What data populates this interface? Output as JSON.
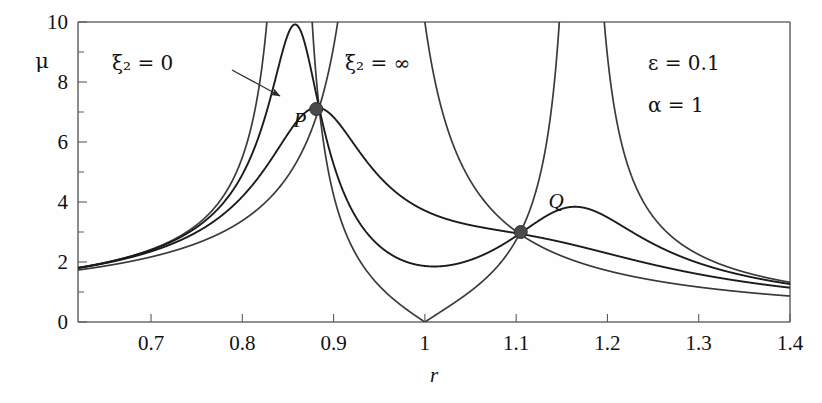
{
  "figure": {
    "title_alt": "Magnification factor versus frequency ratio for a damped vibration absorber",
    "background": "#fefefe",
    "frame_color": "#5b5b5b",
    "curve_color": "#1b1b1b"
  },
  "annotations": {
    "xi_zero": "ξ₂ = 0",
    "xi_inf": "ξ₂ = ∞",
    "epsilon": "ε = 0.1",
    "alpha": "α = 1",
    "point_p": "P",
    "point_q": "Q"
  },
  "axes": {
    "x_label": "r",
    "y_label": "μ",
    "x_ticks": [
      "0.7",
      "0.8",
      "0.9",
      "1",
      "1.1",
      "1.2",
      "1.3",
      "1.4"
    ],
    "x_tick_values": [
      0.7,
      0.8,
      0.9,
      1.0,
      1.1,
      1.2,
      1.3,
      1.4
    ],
    "y_ticks": [
      "0",
      "2",
      "4",
      "6",
      "8",
      "10"
    ],
    "y_tick_values": [
      0,
      2,
      4,
      6,
      8,
      10
    ],
    "y_minor_values": [
      1,
      3,
      5,
      7,
      9
    ],
    "xlim": [
      0.62,
      1.4
    ],
    "ylim": [
      0,
      10
    ],
    "grid": false
  },
  "chart_data": {
    "type": "line",
    "title": "",
    "xlabel": "r",
    "ylabel": "μ",
    "xlim": [
      0.62,
      1.4
    ],
    "ylim": [
      0,
      10
    ],
    "grid": false,
    "legend": "inline-annotations",
    "parameters": {
      "epsilon": 0.1,
      "alpha": 1,
      "mass_ratio_label": "ε = 0.1",
      "tuning_ratio_label": "α = 1"
    },
    "series": [
      {
        "name": "ξ₂ = 0",
        "damping_ratio": 0,
        "style": "solid",
        "description": "Undamped absorber: two vertical asymptotes and a zero at r = 1",
        "asymptotes": [
          0.826,
          1.211
        ],
        "zero_at": 1.0,
        "x": [
          0.62,
          0.65,
          0.7,
          0.75,
          0.78,
          0.8,
          0.81,
          0.82,
          0.824,
          0.828,
          0.835,
          0.85,
          0.88,
          0.92,
          0.95,
          0.98,
          1.0,
          1.02,
          1.05,
          1.08,
          1.105,
          1.14,
          1.17,
          1.19,
          1.205,
          1.215,
          1.23,
          1.26,
          1.3,
          1.35,
          1.4
        ],
        "y": [
          1.75,
          1.95,
          2.55,
          3.75,
          5.2,
          7.2,
          9.0,
          14.0,
          22.0,
          24.0,
          12.0,
          6.2,
          3.2,
          1.85,
          1.1,
          0.45,
          0.0,
          0.45,
          1.15,
          2.1,
          3.0,
          5.0,
          9.5,
          16.0,
          26.0,
          24.0,
          9.0,
          4.2,
          2.4,
          1.5,
          1.05
        ]
      },
      {
        "name": "ξ₂ = 0.10 (light damping)",
        "damping_ratio": 0.1,
        "style": "solid",
        "description": "Lightly damped: tall peak near r = 0.86, secondary peak beyond Q",
        "peaks": [
          {
            "r": 0.86,
            "mu": 9.6
          },
          {
            "r": 1.19,
            "mu": 9.0
          }
        ],
        "x": [
          0.62,
          0.7,
          0.78,
          0.82,
          0.84,
          0.86,
          0.875,
          0.88,
          0.9,
          0.94,
          1.0,
          1.05,
          1.105,
          1.14,
          1.17,
          1.2,
          1.25,
          1.3,
          1.4
        ],
        "y": [
          1.75,
          2.5,
          4.6,
          7.4,
          8.9,
          9.6,
          8.2,
          7.1,
          5.2,
          3.3,
          2.15,
          2.4,
          3.0,
          3.6,
          3.75,
          3.6,
          2.6,
          2.0,
          1.25
        ]
      },
      {
        "name": "ξ₂ = 0.20 (optimal-type damping)",
        "damping_ratio": 0.2,
        "style": "solid",
        "description": "Moderately damped: broad peak near r = 0.92 passing through P and Q",
        "peaks": [
          {
            "r": 0.92,
            "mu": 8.0
          },
          {
            "r": 1.17,
            "mu": 3.75
          }
        ],
        "x": [
          0.62,
          0.7,
          0.78,
          0.84,
          0.88,
          0.9,
          0.92,
          0.95,
          1.0,
          1.05,
          1.105,
          1.14,
          1.17,
          1.2,
          1.25,
          1.3,
          1.4
        ],
        "y": [
          1.72,
          2.4,
          4.0,
          6.2,
          7.1,
          7.7,
          8.0,
          7.6,
          5.6,
          4.0,
          3.0,
          2.4,
          2.05,
          1.85,
          1.6,
          1.4,
          1.05
        ]
      },
      {
        "name": "ξ₂ = ∞",
        "damping_ratio": "infinity",
        "style": "solid",
        "description": "Absorber locked to primary mass: single resonance asymptote near r = 1.14",
        "asymptotes": [
          1.138
        ],
        "x": [
          0.62,
          0.7,
          0.8,
          0.86,
          0.88,
          0.95,
          1.02,
          1.06,
          1.1,
          1.12,
          1.132,
          1.142,
          1.16,
          1.19,
          1.23,
          1.28,
          1.34,
          1.4
        ],
        "y": [
          1.7,
          2.2,
          3.2,
          5.6,
          7.1,
          11.0,
          18.0,
          23.0,
          26.0,
          27.0,
          24.0,
          22.0,
          12.5,
          6.4,
          3.6,
          2.3,
          1.5,
          1.1
        ]
      }
    ],
    "invariant_points": [
      {
        "label": "P",
        "r": 0.881,
        "mu": 7.1,
        "marker": "filled-circle"
      },
      {
        "label": "Q",
        "r": 1.105,
        "mu": 3.0,
        "marker": "filled-circle"
      }
    ],
    "callouts": [
      {
        "text": "ξ₂ = 0",
        "anchor_r": 0.72,
        "anchor_mu": 9.0,
        "arrow_to_r": 0.825,
        "arrow_to_mu": 8.1
      },
      {
        "text": "ξ₂ = ∞",
        "anchor_r": 0.905,
        "anchor_mu": 9.0,
        "arrow": false
      }
    ]
  }
}
